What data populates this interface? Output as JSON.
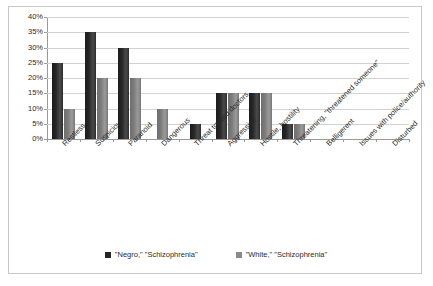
{
  "chart_data": {
    "type": "bar",
    "title": "",
    "subtitle": "",
    "xlabel": "",
    "ylabel": "",
    "ylim": [
      0,
      40
    ],
    "ytick_labels": [
      "0%",
      "5%",
      "10%",
      "15%",
      "20%",
      "25%",
      "30%",
      "35%",
      "40%"
    ],
    "ytick_values": [
      0,
      5,
      10,
      15,
      20,
      25,
      30,
      35,
      40
    ],
    "grid": true,
    "legend_position": "bottom",
    "categories": [
      "Restless",
      "Suspicious",
      "Paranoid",
      "Dangerous",
      "Threat toward doctors",
      "Aggressive",
      "Hostile, hostility",
      "Threatening, \"threatened someone\"",
      "Belligerent",
      "Issues with police/authority",
      "Disturbed"
    ],
    "series": [
      {
        "name": "\"Negro,\" \"Schizophrenia\"",
        "color": "#262626",
        "values": [
          25,
          35,
          30,
          0,
          5,
          15,
          15,
          5,
          0,
          0,
          0
        ]
      },
      {
        "name": "\"White,\" \"Schizophrenia\"",
        "color": "#8a8a8a",
        "values": [
          10,
          20,
          20,
          10,
          0,
          15,
          15,
          5,
          0,
          0,
          0
        ]
      }
    ]
  },
  "legend": {
    "items": [
      {
        "label": "\"Negro,\" \"Schizophrenia\""
      },
      {
        "label": "\"White,\" \"Schizophrenia\""
      }
    ]
  }
}
